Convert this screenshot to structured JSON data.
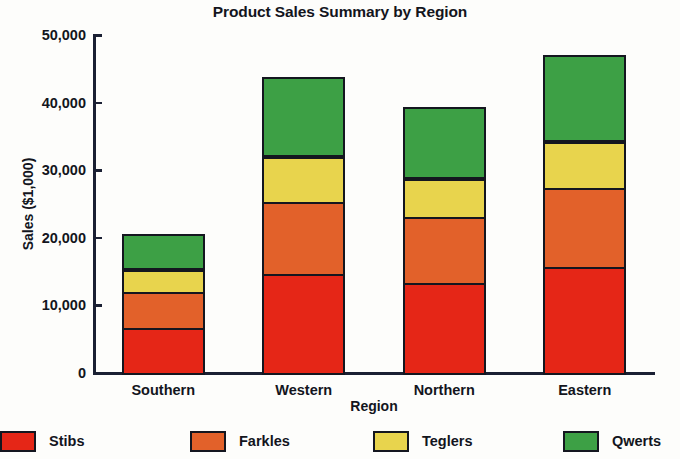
{
  "chart_data": {
    "type": "bar",
    "subtype": "stacked-column",
    "title": "Product Sales Summary by Region",
    "xlabel": "Region",
    "ylabel": "Sales ($1,000)",
    "categories": [
      "Southern",
      "Western",
      "Northern",
      "Eastern"
    ],
    "series": [
      {
        "name": "Stibs",
        "color": "#e52617",
        "values": [
          7000,
          15000,
          13700,
          16000
        ]
      },
      {
        "name": "Farkles",
        "color": "#e2612a",
        "values": [
          5600,
          11000,
          10000,
          12000
        ]
      },
      {
        "name": "Teglers",
        "color": "#e8d44d",
        "values": [
          3550,
          7000,
          6000,
          7100
        ]
      },
      {
        "name": "Qwerts",
        "color": "#3da045",
        "values": [
          5350,
          11700,
          10600,
          12900
        ]
      }
    ],
    "totals": [
      21500,
      44700,
      40300,
      48000
    ],
    "ylim": [
      0,
      50000
    ],
    "yticks": [
      0,
      10000,
      20000,
      30000,
      40000,
      50000
    ],
    "ytick_labels": [
      "0",
      "10,000",
      "20,000",
      "30,000",
      "40,000",
      "50,000"
    ],
    "grid": false,
    "legend_position": "bottom",
    "legend_entries": [
      "Stibs",
      "Farkles",
      "Teglers",
      "Qwerts"
    ],
    "axis_color": "#1a2033",
    "background_color": "#fdfdfb",
    "outline_color": "#14161f"
  }
}
